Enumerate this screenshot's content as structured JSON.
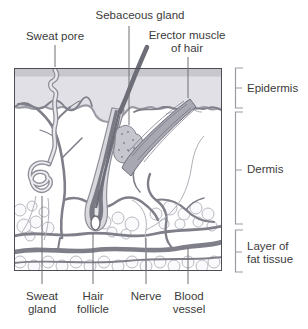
{
  "figure": {
    "callouts_top": {
      "sweat_pore": "Sweat pore",
      "sebaceous_gland": "Sebaceous gland",
      "erector_muscle": {
        "line1": "Erector muscle",
        "line2": "of hair"
      }
    },
    "layers": {
      "epidermis": "Epidermis",
      "dermis": "Dermis",
      "fat": {
        "line1": "Layer of",
        "line2": "fat tissue"
      }
    },
    "callouts_bottom": {
      "sweat_gland": {
        "line1": "Sweat",
        "line2": "gland"
      },
      "hair_follicle": {
        "line1": "Hair",
        "line2": "follicle"
      },
      "nerve": "Nerve",
      "blood_vessel": {
        "line1": "Blood",
        "line2": "vessel"
      }
    }
  },
  "colors": {
    "background": "#ffffff",
    "text": "#3b3b3b",
    "box_border": "#4d4d55",
    "outline_gray": "#8f8f99",
    "epidermis_top": "#c7c7cd",
    "epidermis_body": "#e0e0e6",
    "vessel": "#7f7f8a",
    "hair_shaft": "#6e6e79",
    "follicle_dark": "#7a7a85",
    "muscle": "#a8a8b3",
    "sebaceous": "#c6c6cf",
    "fat_outline": "#b8b8c2",
    "nerve": "#b0b0b9"
  }
}
